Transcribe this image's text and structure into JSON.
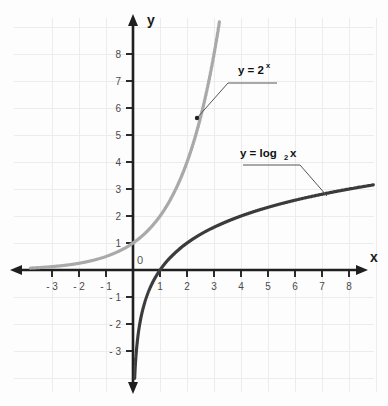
{
  "chart_data": {
    "type": "line",
    "title": "",
    "xlabel": "x",
    "ylabel": "y",
    "grid": true,
    "legend_position": "inline-annotations",
    "xlim": [
      -3.8,
      8.9
    ],
    "ylim": [
      -3.9,
      8.6
    ],
    "x_ticks": [
      "- 3",
      "- 2",
      "- 1",
      "1",
      "2",
      "3",
      "4",
      "5",
      "6",
      "7",
      "8"
    ],
    "x_tick_values": [
      -3,
      -2,
      -1,
      1,
      2,
      3,
      4,
      5,
      6,
      7,
      8
    ],
    "y_ticks": [
      "8",
      "7",
      "6",
      "5",
      "4",
      "3",
      "2",
      "1",
      "- 1",
      "- 2",
      "- 3"
    ],
    "y_tick_values": [
      8,
      7,
      6,
      5,
      4,
      3,
      2,
      1,
      -1,
      -2,
      -3
    ],
    "origin_label": "0",
    "series": [
      {
        "name": "y = 2^x",
        "label_main": "y = 2",
        "label_exponent": "x",
        "color": "#a9a9a9",
        "x": [
          -3.8,
          -3.5,
          -3,
          -2.5,
          -2,
          -1.5,
          -1,
          -0.5,
          0,
          0.5,
          1,
          1.5,
          2,
          2.5,
          3,
          3.1
        ],
        "values": [
          0.072,
          0.088,
          0.125,
          0.177,
          0.25,
          0.354,
          0.5,
          0.707,
          1,
          1.414,
          2,
          2.828,
          4,
          5.657,
          8,
          8.57
        ]
      },
      {
        "name": "y = log2 x",
        "label_main": "y = log",
        "label_subscript": "2",
        "label_tail": "x",
        "color": "#3b3b3b",
        "x": [
          0.07,
          0.1,
          0.15,
          0.25,
          0.35,
          0.5,
          0.7,
          1,
          1.5,
          2,
          3,
          4,
          5,
          6,
          7,
          8,
          8.9
        ],
        "values": [
          -3.84,
          -3.32,
          -2.74,
          -2.0,
          -1.51,
          -1.0,
          -0.51,
          0,
          0.585,
          1,
          1.585,
          2,
          2.322,
          2.585,
          2.807,
          3.0,
          3.15
        ]
      }
    ],
    "annotations": [
      {
        "series": "y = 2^x",
        "anchor_x": 2.37,
        "anchor_y": 5.63
      },
      {
        "series": "y = log2 x",
        "anchor_x": 7.2,
        "anchor_y": 2.85
      }
    ]
  }
}
